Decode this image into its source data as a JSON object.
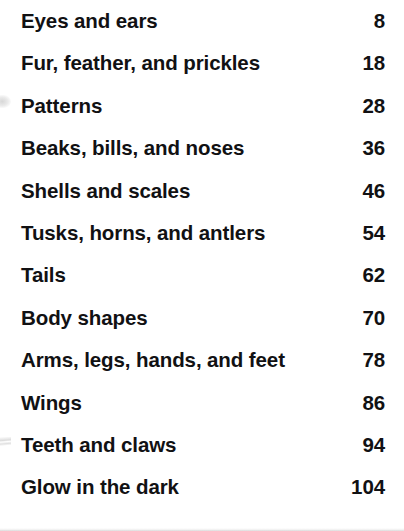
{
  "page": {
    "type": "book-table-of-contents",
    "background_color": "#ffffff",
    "text_color": "#111113"
  },
  "contents": {
    "entries": [
      {
        "title": "Eyes and ears",
        "page": "8"
      },
      {
        "title": "Fur, feather, and prickles",
        "page": "18"
      },
      {
        "title": "Patterns",
        "page": "28"
      },
      {
        "title": "Beaks, bills, and noses",
        "page": "36"
      },
      {
        "title": "Shells and scales",
        "page": "46"
      },
      {
        "title": "Tusks, horns, and antlers",
        "page": "54"
      },
      {
        "title": "Tails",
        "page": "62"
      },
      {
        "title": "Body shapes",
        "page": "70"
      },
      {
        "title": "Arms, legs, hands, and feet",
        "page": "78"
      },
      {
        "title": "Wings",
        "page": "86"
      },
      {
        "title": "Teeth and claws",
        "page": "94"
      },
      {
        "title": "Glow in the dark",
        "page": "104"
      }
    ]
  }
}
